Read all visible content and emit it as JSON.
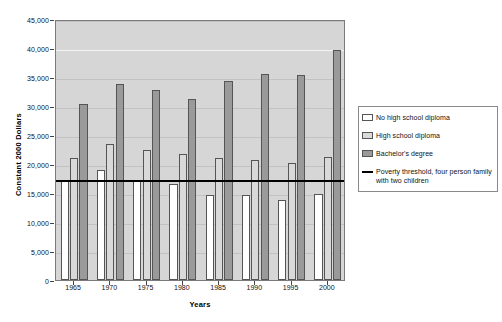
{
  "chart_data": {
    "type": "bar",
    "title": "",
    "xlabel": "Years",
    "ylabel": "Constant 2000 Dollars",
    "categories": [
      "1965",
      "1970",
      "1975",
      "1980",
      "1985",
      "1990",
      "1995",
      "2000"
    ],
    "ylim": [
      0,
      45000
    ],
    "ytick_labels": [
      "0",
      "5,000",
      "10,000",
      "15,000",
      "20,000",
      "25,000",
      "30,000",
      "35,000",
      "40,000",
      "45,000"
    ],
    "ytick_values": [
      0,
      5000,
      10000,
      15000,
      20000,
      25000,
      30000,
      35000,
      40000,
      45000
    ],
    "grid": true,
    "legend_position": "right",
    "series": [
      {
        "name": "No high school diploma",
        "color": "#ffffff",
        "values": [
          17200,
          18900,
          17100,
          16500,
          14600,
          14600,
          13800,
          14800
        ]
      },
      {
        "name": "High school diploma",
        "color": "#d9d9d9",
        "values": [
          21000,
          23500,
          22400,
          21800,
          21000,
          20700,
          20200,
          21200
        ]
      },
      {
        "name": "Bachelor's degree",
        "color": "#9a9a9a",
        "values": [
          30400,
          33800,
          32800,
          31200,
          34300,
          35600,
          35300,
          39700
        ]
      }
    ],
    "reference_line": {
      "name": "Poverty threshold, four person family with two children",
      "color": "#000000",
      "value": 17500
    }
  },
  "legend": {
    "items": [
      {
        "label": "No high school diploma",
        "swatch": "white-square-swatch"
      },
      {
        "label": "High school diploma",
        "swatch": "light-gray-square-swatch"
      },
      {
        "label": "Bachelor's degree",
        "swatch": "dark-gray-square-swatch"
      },
      {
        "label": "Poverty threshold, four person family with two children",
        "swatch": "black-line-swatch"
      }
    ]
  },
  "axes": {
    "y_title": "Constant 2000 Dollars",
    "x_title": "Years"
  },
  "colors": {
    "plot_background": "#d6d6d6",
    "series_no_diploma": "#ffffff",
    "series_hs_diploma": "#d9d9d9",
    "series_bachelors": "#9a9a9a",
    "poverty_line": "#000000",
    "gridline": "#c2c2c2",
    "axis_text": "#111111"
  }
}
